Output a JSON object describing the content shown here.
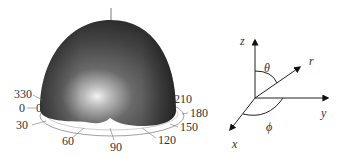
{
  "pattern": {
    "angle_labels": [
      {
        "text": "330",
        "x": 14,
        "y": 98
      },
      {
        "text": "0",
        "x": 19,
        "y": 112
      },
      {
        "text": "0",
        "x": 36,
        "y": 112
      },
      {
        "text": "30",
        "x": 16,
        "y": 129
      },
      {
        "text": "60",
        "x": 62,
        "y": 145
      },
      {
        "text": "90",
        "x": 110,
        "y": 151
      },
      {
        "text": "120",
        "x": 158,
        "y": 144
      },
      {
        "text": "150",
        "x": 180,
        "y": 131
      },
      {
        "text": "180",
        "x": 190,
        "y": 117
      },
      {
        "text": "210",
        "x": 174,
        "y": 103
      }
    ]
  },
  "coords": {
    "z_label": "z",
    "r_label": "r",
    "y_label": "y",
    "x_label": "x",
    "theta_label": "θ",
    "phi_label": "ϕ"
  },
  "colors": {
    "dome_dark": "#2e2e2e",
    "dome_mid": "#5a5a5a",
    "dome_highlight": "#e8e8e8",
    "axis_line": "#444444"
  }
}
